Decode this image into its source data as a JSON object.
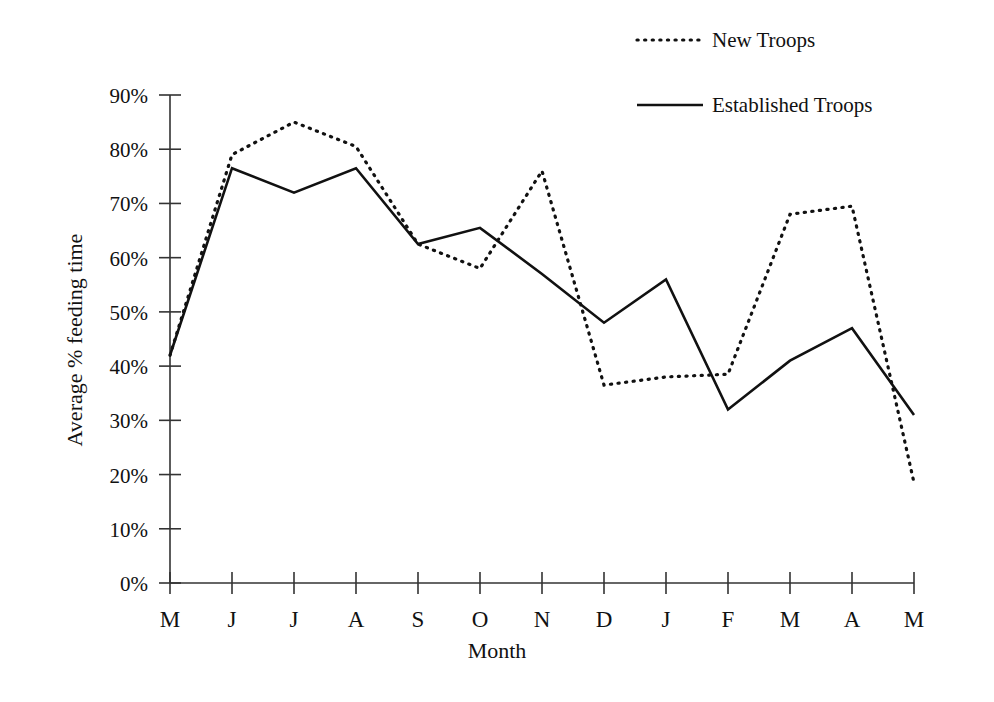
{
  "chart_data": {
    "type": "line",
    "title": "",
    "xlabel": "Month",
    "ylabel": "Average % feeding time",
    "categories": [
      "M",
      "J",
      "J",
      "A",
      "S",
      "O",
      "N",
      "D",
      "J",
      "F",
      "M",
      "A",
      "M"
    ],
    "ylim": [
      0,
      90
    ],
    "ytick_labels": [
      "0%",
      "10%",
      "20%",
      "30%",
      "40%",
      "50%",
      "60%",
      "70%",
      "80%",
      "90%"
    ],
    "ytick_values": [
      0,
      10,
      20,
      30,
      40,
      50,
      60,
      70,
      80,
      90
    ],
    "grid": false,
    "legend_position": "top-right",
    "series": [
      {
        "name": "New Troops",
        "style": "dotted",
        "color": "#111111",
        "values": [
          42,
          79,
          85,
          80.5,
          62.5,
          58,
          76,
          36.5,
          38,
          38.5,
          68,
          69.5,
          18.5
        ]
      },
      {
        "name": "Established Troops",
        "style": "solid",
        "color": "#111111",
        "values": [
          42,
          76.5,
          72,
          76.5,
          62.5,
          65.5,
          57,
          48,
          56,
          32,
          41,
          47,
          31
        ]
      }
    ]
  },
  "axes": {
    "y_axis_title": "Average % feeding time",
    "x_axis_title": "Month"
  },
  "legend": {
    "entries": [
      {
        "label": "New Troops",
        "marker": "dotted-line-swatch"
      },
      {
        "label": "Established Troops",
        "marker": "solid-line-swatch"
      }
    ]
  }
}
